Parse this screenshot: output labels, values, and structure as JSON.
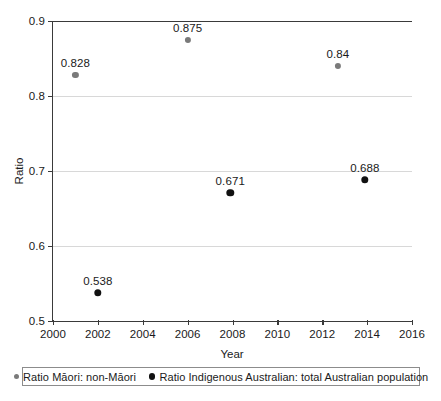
{
  "chart_data": {
    "type": "scatter",
    "title": "",
    "xlabel": "Year",
    "ylabel": "Ratio",
    "xlim": [
      2000,
      2016
    ],
    "ylim": [
      0.5,
      0.9
    ],
    "grid": true,
    "legend_position": "bottom",
    "x_ticks": [
      "2000",
      "2002",
      "2004",
      "2006",
      "2008",
      "2010",
      "2012",
      "2014",
      "2016"
    ],
    "x_tick_values": [
      2000,
      2002,
      2004,
      2006,
      2008,
      2010,
      2012,
      2014,
      2016
    ],
    "y_ticks": [
      "0.5",
      "0.6",
      "0.7",
      "0.8",
      "0.9"
    ],
    "y_tick_values": [
      0.5,
      0.6,
      0.7,
      0.8,
      0.9
    ],
    "series": [
      {
        "name": "Ratio Māori: non-Māori",
        "key": "s-maori",
        "color": "#7a7a7a",
        "points": [
          {
            "x": 2001,
            "y": 0.828,
            "label": "0.828"
          },
          {
            "x": 2006,
            "y": 0.875,
            "label": "0.875"
          },
          {
            "x": 2012.7,
            "y": 0.84,
            "label": "0.84"
          }
        ]
      },
      {
        "name": "Ratio Indigenous Australian: total Australian population",
        "key": "s-indig",
        "color": "#111111",
        "points": [
          {
            "x": 2002,
            "y": 0.538,
            "label": "0.538"
          },
          {
            "x": 2007.9,
            "y": 0.671,
            "label": "0.671"
          },
          {
            "x": 2013.9,
            "y": 0.688,
            "label": "0.688"
          }
        ]
      }
    ]
  },
  "legend": {
    "entries": [
      {
        "label": "Ratio Māori: non-Māori",
        "key": "s-maori"
      },
      {
        "label": "Ratio Indigenous Australian: total Australian population",
        "key": "s-indig"
      }
    ]
  }
}
